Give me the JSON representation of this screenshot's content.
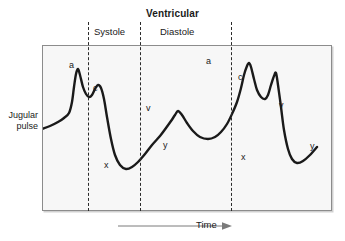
{
  "figure": {
    "background_color": "#ffffff",
    "plot_background_color": "#f7f7f7",
    "frame_color": "#8c8c8c",
    "curve_color": "#1a1a1a",
    "divider_color": "#2b2b2b"
  },
  "header": {
    "ventricular_label": "Ventricular",
    "systole_label": "Systole",
    "diastole_label": "Diastole"
  },
  "y_axis": {
    "label_line1": "Jugular",
    "label_line2": "pulse"
  },
  "x_axis": {
    "label": "Time",
    "arrow_icon": "right-arrow-icon"
  },
  "dividers": [
    {
      "name": "systole-start",
      "x": 88
    },
    {
      "name": "systole-end",
      "x": 140
    },
    {
      "name": "diastole-end",
      "x": 231
    }
  ],
  "wave_labels": [
    {
      "id": "a1",
      "text": "a",
      "x": 69,
      "y": 60
    },
    {
      "id": "c1",
      "text": "c",
      "x": 93,
      "y": 83
    },
    {
      "id": "x1",
      "text": "x",
      "x": 104,
      "y": 160
    },
    {
      "id": "v1",
      "text": "v",
      "x": 146,
      "y": 103
    },
    {
      "id": "y1",
      "text": "y",
      "x": 163,
      "y": 140
    },
    {
      "id": "a2",
      "text": "a",
      "x": 206,
      "y": 56
    },
    {
      "id": "c2",
      "text": "c",
      "x": 238,
      "y": 72
    },
    {
      "id": "x2",
      "text": "x",
      "x": 241,
      "y": 152
    },
    {
      "id": "v2",
      "text": "v",
      "x": 279,
      "y": 100
    },
    {
      "id": "y2",
      "text": "y",
      "x": 310,
      "y": 141
    }
  ],
  "chart_data": {
    "type": "line",
    "title": "Ventricular",
    "xlabel": "Time",
    "ylabel": "Jugular pulse",
    "grid": false,
    "legend": null,
    "xlim": [
      0,
      290
    ],
    "ylim": [
      0,
      166
    ],
    "annotations": [
      {
        "label": "Ventricular",
        "position": "top-center",
        "bold": true
      },
      {
        "label": "Systole",
        "position": "top",
        "span_x": [
          88,
          140
        ]
      },
      {
        "label": "Diastole",
        "position": "top",
        "span_x": [
          140,
          231
        ]
      }
    ],
    "vertical_dashed_lines_x": [
      46,
      98,
      189
    ],
    "series": [
      {
        "name": "Jugular venous pulse",
        "color": "#1a1a1a",
        "points": [
          [
            0,
            84
          ],
          [
            8,
            81
          ],
          [
            16,
            77
          ],
          [
            22,
            73
          ],
          [
            27,
            68
          ],
          [
            30,
            57
          ],
          [
            32,
            42
          ],
          [
            34,
            29
          ],
          [
            36,
            24
          ],
          [
            38,
            30
          ],
          [
            41,
            42
          ],
          [
            44,
            49
          ],
          [
            47,
            52
          ],
          [
            50,
            50
          ],
          [
            53,
            44
          ],
          [
            56,
            40
          ],
          [
            59,
            43
          ],
          [
            62,
            54
          ],
          [
            65,
            72
          ],
          [
            69,
            94
          ],
          [
            73,
            110
          ],
          [
            78,
            120
          ],
          [
            84,
            124
          ],
          [
            90,
            122
          ],
          [
            96,
            117
          ],
          [
            103,
            109
          ],
          [
            110,
            100
          ],
          [
            118,
            91
          ],
          [
            124,
            83
          ],
          [
            129,
            76
          ],
          [
            133,
            70
          ],
          [
            136,
            66
          ],
          [
            140,
            70
          ],
          [
            145,
            78
          ],
          [
            151,
            86
          ],
          [
            158,
            92
          ],
          [
            166,
            94
          ],
          [
            173,
            92
          ],
          [
            179,
            87
          ],
          [
            185,
            79
          ],
          [
            190,
            69
          ],
          [
            195,
            57
          ],
          [
            199,
            43
          ],
          [
            202,
            30
          ],
          [
            205,
            21
          ],
          [
            207,
            18
          ],
          [
            209,
            22
          ],
          [
            212,
            34
          ],
          [
            215,
            45
          ],
          [
            219,
            52
          ],
          [
            223,
            54
          ],
          [
            226,
            50
          ],
          [
            229,
            40
          ],
          [
            232,
            31
          ],
          [
            234,
            28
          ],
          [
            236,
            40
          ],
          [
            239,
            62
          ],
          [
            242,
            85
          ],
          [
            246,
            104
          ],
          [
            250,
            114
          ],
          [
            255,
            118
          ],
          [
            261,
            116
          ],
          [
            268,
            110
          ],
          [
            275,
            102
          ],
          [
            281,
            95
          ],
          [
            286,
            90
          ],
          [
            290,
            86
          ],
          [
            235,
            28
          ]
        ]
      }
    ]
  }
}
